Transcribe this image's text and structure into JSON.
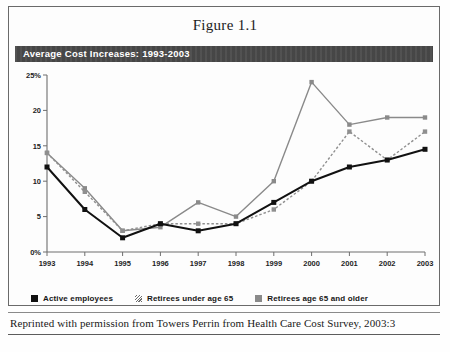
{
  "figure": {
    "title": "Figure 1.1",
    "banner_title": "Average Cost Increases: 1993-2003",
    "source_note": "Reprinted with permission from Towers Perrin from Health Care Cost Survey, 2003:3"
  },
  "legend": {
    "items": [
      {
        "label": "Active employees",
        "marker": "filled-square-black",
        "color": "#111111"
      },
      {
        "label": "Retirees under age 65",
        "marker": "hatched-square",
        "color": "#8f8f8f"
      },
      {
        "label": "Retirees age 65 and older",
        "marker": "filled-square-grey",
        "color": "#8a8a8a"
      }
    ]
  },
  "chart_data": {
    "type": "line",
    "title": "Average Cost Increases: 1993-2003",
    "xlabel": "",
    "ylabel": "",
    "categories": [
      "1993",
      "1994",
      "1995",
      "1996",
      "1997",
      "1998",
      "1999",
      "2000",
      "2001",
      "2002",
      "2003"
    ],
    "ylim": [
      0,
      25
    ],
    "yticks": [
      0,
      5,
      10,
      15,
      20,
      25
    ],
    "ytick_labels": [
      "0%",
      "5",
      "10",
      "15",
      "20",
      "25%"
    ],
    "grid": false,
    "legend_position": "bottom",
    "series": [
      {
        "name": "Active employees",
        "color": "#111111",
        "style": "solid",
        "values": [
          12,
          6,
          2,
          4,
          3,
          4,
          7,
          10,
          12,
          13,
          14.5
        ]
      },
      {
        "name": "Retirees under age 65",
        "color": "#8f8f8f",
        "style": "dotted",
        "values": [
          14,
          8.5,
          3,
          4,
          4,
          4,
          6,
          10,
          17,
          13,
          17
        ]
      },
      {
        "name": "Retirees age 65 and older",
        "color": "#8a8a8a",
        "style": "solid",
        "values": [
          14,
          9,
          3,
          3.5,
          7,
          5,
          10,
          24,
          18,
          19,
          19
        ]
      }
    ]
  }
}
